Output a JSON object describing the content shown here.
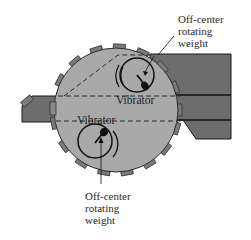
{
  "diagram": {
    "labels": {
      "top_weight": [
        "Off-center",
        "rotating",
        "weight"
      ],
      "bottom_weight": [
        "Off-center",
        "rotating",
        "weight"
      ],
      "upper_vibrator": "Vibrator",
      "lower_vibrator": "Vibrator"
    },
    "colors": {
      "drum_fill": "#a9a9a9",
      "chute_fill": "#6d6d6d",
      "tooth_fill": "#7a7a7a",
      "outline": "#1a1a1a",
      "background": "#ffffff"
    }
  }
}
